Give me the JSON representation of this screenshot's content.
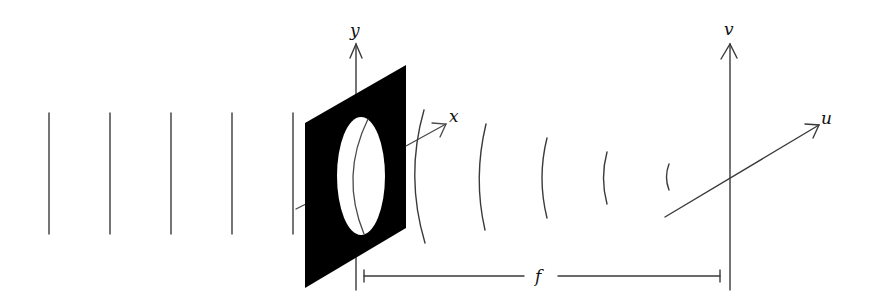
{
  "diagram": {
    "colors": {
      "line": "#3a3a3a",
      "panel": "#000000",
      "background": "#ffffff"
    },
    "axes": {
      "aperture_plane": {
        "vertical_label": "y",
        "horizontal_label": "x"
      },
      "focal_plane": {
        "vertical_label": "v",
        "horizontal_label": "u"
      }
    },
    "dimension": {
      "label": "f"
    },
    "incident_plane_wavefronts": [
      {
        "x": 49
      },
      {
        "x": 110
      },
      {
        "x": 171
      },
      {
        "x": 232
      },
      {
        "x": 293
      }
    ],
    "converging_wavefronts": [
      {
        "top": [
          424,
          110
        ],
        "mid": [
          414,
          176
        ],
        "bottom": [
          425,
          243
        ]
      },
      {
        "top": [
          486,
          124
        ],
        "mid": [
          478,
          178
        ],
        "bottom": [
          485,
          230
        ]
      },
      {
        "top": [
          547,
          138
        ],
        "mid": [
          541,
          178
        ],
        "bottom": [
          547,
          218
        ]
      },
      {
        "top": [
          607,
          152
        ],
        "mid": [
          603,
          178
        ],
        "bottom": [
          607,
          204
        ]
      },
      {
        "top": [
          669,
          164
        ],
        "mid": [
          666,
          177
        ],
        "bottom": [
          669,
          190
        ]
      }
    ]
  }
}
